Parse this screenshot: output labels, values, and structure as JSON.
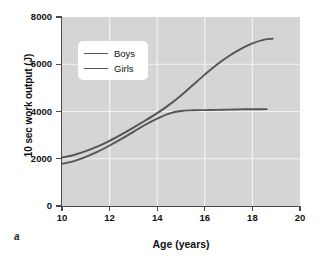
{
  "figure": {
    "panel_letter": "a"
  },
  "chart_data": {
    "type": "line",
    "title": "",
    "xlabel": "Age (years)",
    "ylabel": "10 sec work output (J)",
    "xlim": [
      10,
      20
    ],
    "ylim": [
      0,
      8000
    ],
    "xticks": [
      "10",
      "12",
      "14",
      "16",
      "18",
      "20"
    ],
    "xtick_values": [
      10,
      12,
      14,
      16,
      18,
      20
    ],
    "yticks": [
      "0",
      "2000",
      "4000",
      "6000",
      "8000"
    ],
    "ytick_values": [
      0,
      2000,
      4000,
      6000,
      8000
    ],
    "grid": true,
    "grid_color": "#f2f2f2",
    "plot_background": "#d5d5d5",
    "line_color": "#555555",
    "legend_position": "upper left",
    "legend_entries": [
      "Boys",
      "Girls"
    ],
    "series": [
      {
        "name": "Boys",
        "color": "#555555",
        "x": [
          10.0,
          10.5,
          11.0,
          11.5,
          12.0,
          12.5,
          13.0,
          13.5,
          14.0,
          14.5,
          15.0,
          15.5,
          16.0,
          16.5,
          17.0,
          17.5,
          18.0,
          18.5,
          18.85
        ],
        "y": [
          2050,
          2160,
          2320,
          2520,
          2760,
          3030,
          3320,
          3620,
          3930,
          4280,
          4680,
          5120,
          5560,
          5980,
          6340,
          6640,
          6880,
          7040,
          7080
        ]
      },
      {
        "name": "Girls",
        "color": "#555555",
        "x": [
          10.0,
          10.5,
          11.0,
          11.5,
          12.0,
          12.5,
          13.0,
          13.5,
          14.0,
          14.5,
          15.0,
          15.5,
          16.0,
          16.5,
          17.0,
          17.5,
          18.0,
          18.6
        ],
        "y": [
          1780,
          1900,
          2080,
          2300,
          2560,
          2840,
          3140,
          3440,
          3700,
          3910,
          4020,
          4050,
          4060,
          4070,
          4080,
          4090,
          4095,
          4100
        ]
      }
    ]
  }
}
